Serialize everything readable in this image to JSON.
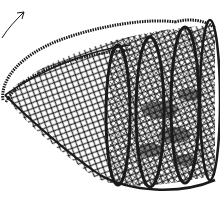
{
  "image": {
    "subject": "pen-and-ink drawing of a conical mesh fish trap with hoops and a rope handle",
    "background": "#ffffff",
    "ink": "#1a1a1a"
  }
}
